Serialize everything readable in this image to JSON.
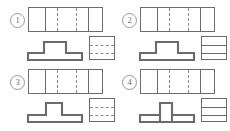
{
  "figure": {
    "kind": "orthographic-projection-multiple-choice",
    "background_color": "#fefefe",
    "line_color": "#6b6b6b",
    "hidden_line_color": "#8c8c8c",
    "numeral_color": "#6e6e6e"
  },
  "options": [
    {
      "id": "option-1",
      "label": "①",
      "label_plain": "1",
      "top_view": {
        "name": "top-view",
        "width": 75,
        "height": 25,
        "solid_vertical_lines": [
          16,
          59
        ],
        "dashed_vertical_lines": [
          28,
          47
        ]
      },
      "front_view": {
        "name": "front-view",
        "profile": "inverted-T-with-wide-raised-center",
        "path": "M 2 50 L 2 36 L 18 36 L 18 14 L 40 14 L 40 36 L 56 36 L 56 50 Z"
      },
      "side_view": {
        "name": "side-view",
        "width": 26,
        "height": 24,
        "solid_horizontal_lines": [],
        "dashed_horizontal_lines": [
          8,
          16
        ]
      }
    },
    {
      "id": "option-2",
      "label": "②",
      "label_plain": "2",
      "top_view": {
        "name": "top-view",
        "width": 75,
        "height": 25,
        "solid_vertical_lines": [
          16,
          59
        ],
        "dashed_vertical_lines": [
          28,
          47
        ]
      },
      "front_view": {
        "name": "front-view",
        "profile": "inverted-T-with-wide-raised-center",
        "path": "M 2 50 L 2 36 L 18 36 L 18 14 L 40 14 L 40 36 L 56 36 L 56 50 Z"
      },
      "side_view": {
        "name": "side-view",
        "width": 26,
        "height": 24,
        "solid_horizontal_lines": [
          8,
          16
        ],
        "dashed_horizontal_lines": []
      }
    },
    {
      "id": "option-3",
      "label": "③",
      "label_plain": "3",
      "top_view": {
        "name": "top-view",
        "width": 75,
        "height": 25,
        "solid_vertical_lines": [
          16,
          59
        ],
        "dashed_vertical_lines": [
          28,
          47
        ]
      },
      "front_view": {
        "name": "front-view",
        "profile": "inverted-T-with-narrow-raised-center",
        "path": "M 2 50 L 2 36 L 20 36 L 20 12 L 36 12 L 36 36 L 56 36 L 56 50 Z"
      },
      "side_view": {
        "name": "side-view",
        "width": 26,
        "height": 24,
        "solid_horizontal_lines": [],
        "dashed_horizontal_lines": [
          8,
          16
        ]
      }
    },
    {
      "id": "option-4",
      "label": "④",
      "label_plain": "4",
      "top_view": {
        "name": "top-view",
        "width": 75,
        "height": 25,
        "solid_vertical_lines": [
          16,
          59
        ],
        "dashed_vertical_lines": [
          28,
          47
        ]
      },
      "front_view": {
        "name": "front-view",
        "profile": "inverted-T-with-narrow-tall-raised-center",
        "path": "M 2 50 L 2 36 L 22 36 L 22 12 L 34 12 L 34 36 L 56 36 L 56 50 Z M 22 36 L 22 50 M 34 36 L 34 50"
      },
      "side_view": {
        "name": "side-view",
        "width": 26,
        "height": 24,
        "solid_horizontal_lines": [
          8,
          16
        ],
        "dashed_horizontal_lines": []
      }
    }
  ]
}
